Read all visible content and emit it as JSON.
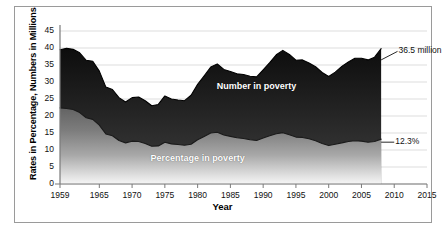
{
  "chart_data": {
    "type": "area",
    "title": "",
    "subtitle": "",
    "xlabel": "Year",
    "ylabel": "Rates in Percentage, Numbers in Millions",
    "xlim": [
      1959,
      2015
    ],
    "ylim": [
      0,
      45
    ],
    "grid": true,
    "grid_axis": "y",
    "legend_position": "inline-on-area",
    "x_tick_labels": [
      "1959",
      "1965",
      "1970",
      "1975",
      "1980",
      "1985",
      "1990",
      "1995",
      "2000",
      "2005",
      "2010",
      "2015"
    ],
    "x_tick_values": [
      1959,
      1965,
      1970,
      1975,
      1980,
      1985,
      1990,
      1995,
      2000,
      2005,
      2010,
      2015
    ],
    "y_tick_labels": [
      "0",
      "5",
      "10",
      "15",
      "20",
      "25",
      "30",
      "35",
      "40",
      "45"
    ],
    "y_tick_values": [
      0,
      5,
      10,
      15,
      20,
      25,
      30,
      35,
      40,
      45
    ],
    "x": [
      1959,
      1960,
      1961,
      1962,
      1963,
      1964,
      1965,
      1966,
      1967,
      1968,
      1969,
      1970,
      1971,
      1972,
      1973,
      1974,
      1975,
      1976,
      1977,
      1978,
      1979,
      1980,
      1981,
      1982,
      1983,
      1984,
      1985,
      1986,
      1987,
      1988,
      1989,
      1990,
      1991,
      1992,
      1993,
      1994,
      1995,
      1996,
      1997,
      1998,
      1999,
      2000,
      2001,
      2002,
      2003,
      2004,
      2005,
      2006,
      2007,
      2008
    ],
    "series": [
      {
        "name": "Number in poverty",
        "units": "millions",
        "label_x": 1989,
        "label_y": 28.5,
        "values": [
          39.5,
          39.9,
          39.6,
          38.6,
          36.4,
          36.1,
          33.2,
          28.5,
          27.8,
          25.4,
          24.1,
          25.4,
          25.6,
          24.5,
          23.0,
          23.4,
          25.9,
          25.0,
          24.7,
          24.5,
          26.1,
          29.3,
          31.8,
          34.4,
          35.3,
          33.7,
          33.1,
          32.4,
          32.2,
          31.7,
          31.5,
          33.6,
          35.7,
          38.0,
          39.3,
          38.1,
          36.4,
          36.5,
          35.6,
          34.5,
          32.8,
          31.6,
          32.9,
          34.6,
          35.9,
          37.0,
          37.0,
          36.5,
          37.3,
          39.8
        ]
      },
      {
        "name": "Percentage in poverty",
        "units": "percent",
        "label_x": 1980,
        "label_y": 7.5,
        "values": [
          22.4,
          22.2,
          21.9,
          21.0,
          19.5,
          19.0,
          17.3,
          14.7,
          14.2,
          12.8,
          12.1,
          12.6,
          12.5,
          11.9,
          11.1,
          11.2,
          12.3,
          11.8,
          11.6,
          11.4,
          11.7,
          13.0,
          14.0,
          15.0,
          15.2,
          14.4,
          14.0,
          13.6,
          13.4,
          13.0,
          12.8,
          13.5,
          14.2,
          14.8,
          15.1,
          14.5,
          13.8,
          13.7,
          13.3,
          12.7,
          11.9,
          11.3,
          11.7,
          12.1,
          12.5,
          12.7,
          12.6,
          12.3,
          12.5,
          13.2
        ]
      }
    ],
    "annotations": [
      {
        "text": "36.5 million",
        "series": "Number in poverty",
        "at_x": 2008,
        "at_y": 36.5,
        "label_x": 2010.5,
        "label_y": 39.0
      },
      {
        "text": "12.3%",
        "series": "Percentage in poverty",
        "at_x": 2008,
        "at_y": 12.3,
        "label_x": 2010.0,
        "label_y": 12.3
      }
    ],
    "colors": {
      "number_area_top": "#151515",
      "number_area_bottom": "#4a4a4a",
      "percentage_area_top": "#6e6e6e",
      "percentage_area_bottom": "#f2f2f2",
      "gridline": "#d4d4d4",
      "axis": "#7b7b7b",
      "frame": "#9a9a9a",
      "text": "#111111",
      "series_label_text": "#ffffff"
    }
  },
  "figure": {
    "frame_visible": true,
    "background": "#ffffff"
  }
}
